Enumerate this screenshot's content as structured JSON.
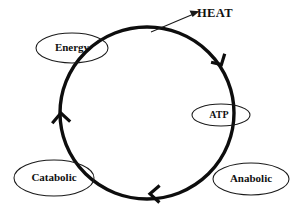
{
  "diagram": {
    "background_color": "#ffffff",
    "stroke_color": "#0d0d0d",
    "label_color": "#111111",
    "cycle": {
      "name": "metabolic-cycle-ring",
      "direction": "clockwise",
      "center": {
        "x": 147,
        "y": 113
      },
      "radius_x": 87,
      "radius_y": 86,
      "stroke_width": 3.4
    },
    "nodes": [
      {
        "id": "energy",
        "label": "Energy",
        "shape": "ellipse",
        "cx": 72,
        "cy": 48,
        "rx": 36,
        "ry": 15
      },
      {
        "id": "atp",
        "label": "ATP",
        "shape": "ellipse",
        "cx": 221,
        "cy": 115,
        "rx": 29,
        "ry": 11
      },
      {
        "id": "catabolic",
        "label": "Catabolic",
        "shape": "ellipse",
        "cx": 54,
        "cy": 178,
        "rx": 40,
        "ry": 18
      },
      {
        "id": "anabolic",
        "label": "Anabolic",
        "shape": "ellipse",
        "cx": 251,
        "cy": 179,
        "rx": 38,
        "ry": 16
      }
    ],
    "annotations": [
      {
        "id": "heat",
        "label": "HEAT",
        "text_x": 215,
        "text_y": 14,
        "arrow_from": {
          "x": 152,
          "y": 32
        },
        "arrow_to": {
          "x": 197,
          "y": 12
        }
      }
    ],
    "cycle_arrows": [
      {
        "id": "arrow-upper-right",
        "position": "upper-right",
        "points_toward": "clockwise-down"
      },
      {
        "id": "arrow-bottom",
        "position": "bottom",
        "points_toward": "clockwise-left"
      },
      {
        "id": "arrow-left",
        "position": "left",
        "points_toward": "clockwise-up"
      }
    ]
  }
}
